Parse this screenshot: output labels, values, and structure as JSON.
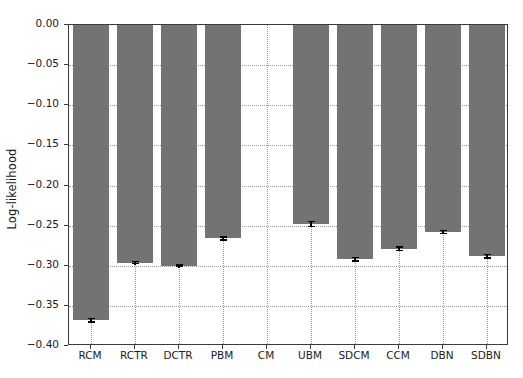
{
  "chart_data": {
    "type": "bar",
    "title": "",
    "xlabel": "",
    "ylabel": "Log-likelihood",
    "categories": [
      "RCM",
      "RCTR",
      "DCTR",
      "PBM",
      "CM",
      "UBM",
      "SDCM",
      "CCM",
      "DBN",
      "SDBN"
    ],
    "values": [
      -0.368,
      -0.296,
      -0.3,
      -0.266,
      0.0,
      -0.248,
      -0.292,
      -0.279,
      -0.258,
      -0.288
    ],
    "errors": [
      0.003,
      0.002,
      0.002,
      0.003,
      0.0,
      0.004,
      0.003,
      0.003,
      0.003,
      0.003
    ],
    "ylim": [
      -0.4,
      0.0
    ],
    "yticks": [
      0.0,
      -0.05,
      -0.1,
      -0.15,
      -0.2,
      -0.25,
      -0.3,
      -0.35,
      -0.4
    ],
    "ytick_labels": [
      "0.00",
      "−0.05",
      "−0.10",
      "−0.15",
      "−0.20",
      "−0.25",
      "−0.30",
      "−0.35",
      "−0.40"
    ],
    "grid": true,
    "grid_style": "dotted",
    "legend": null,
    "bar_color": "#737373",
    "error_color": "#000000",
    "axis_color": "#3b3b3b",
    "grid_color": "#9a9a9a",
    "background": "#ffffff"
  }
}
